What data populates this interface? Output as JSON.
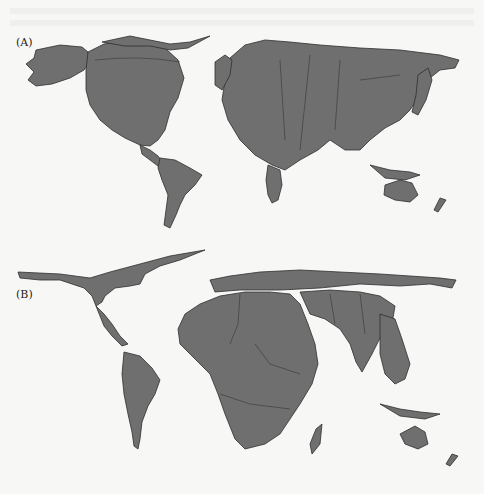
{
  "figure": {
    "panels": [
      {
        "label": "(A)",
        "description": "World cartogram emphasizing North America, Europe and East Asia"
      },
      {
        "label": "(B)",
        "description": "World cartogram emphasizing Africa and South Asia"
      }
    ],
    "colors": {
      "land": "#6f6f6f",
      "border": "#2e2e2e",
      "background": "#f7f7f5"
    }
  }
}
